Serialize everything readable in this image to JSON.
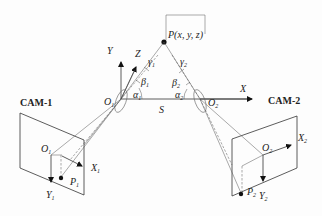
{
  "point": {
    "label": "P(x, y, z)"
  },
  "world_axes": {
    "y": "Y",
    "z": "Z",
    "x": "X"
  },
  "baseline": {
    "label": "S"
  },
  "camera_left": {
    "name": "CAM-1",
    "optical_center": "O",
    "optical_center_sub": "1",
    "image_origin": "O",
    "image_origin_sub": "1",
    "x_axis": "X",
    "x_axis_sub": "1",
    "y_axis": "Y",
    "y_axis_sub": "1",
    "image_point": "P",
    "image_point_sub": "1",
    "angles": {
      "alpha": "α",
      "alpha_sub": "1",
      "beta": "β",
      "beta_sub": "1",
      "gamma": "γ",
      "gamma_sub": "1"
    }
  },
  "camera_right": {
    "name": "CAM-2",
    "optical_center": "O",
    "optical_center_sub": "2",
    "image_origin": "O",
    "image_origin_sub": "2",
    "x_axis": "X",
    "x_axis_sub": "2",
    "y_axis": "Y",
    "y_axis_sub": "2",
    "image_point": "P",
    "image_point_sub": "2",
    "angles": {
      "alpha": "α",
      "alpha_sub": "2",
      "beta": "β",
      "beta_sub": "2",
      "gamma": "γ",
      "gamma_sub": "2"
    }
  },
  "colors": {
    "line": "#333333",
    "background": "#fdfdfd"
  }
}
